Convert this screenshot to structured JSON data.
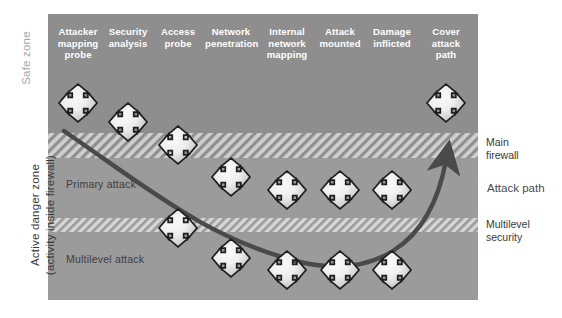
{
  "figure": {
    "type": "diagram"
  },
  "axis_labels": {
    "safe_zone": "Safe zone",
    "danger_zone": "Active danger zone\n(activity inside firewall)"
  },
  "zone_captions": {
    "primary_attack": "Primary attack",
    "multilevel_attack": "Multilevel attack"
  },
  "right_annotations": {
    "main_firewall": "Main\nfirewall",
    "multilevel_security": "Multilevel\nsecurity",
    "attack_path": "Attack path"
  },
  "columns": [
    {
      "label": "Attacker\nmapping\nprobe",
      "x": 78
    },
    {
      "label": "Security\nanalysis",
      "x": 128
    },
    {
      "label": "Access\nprobe",
      "x": 178
    },
    {
      "label": "Network\npenetration",
      "x": 231
    },
    {
      "label": "Internal\nnetwork\nmapping",
      "x": 287
    },
    {
      "label": "Attack\nmounted",
      "x": 340
    },
    {
      "label": "Damage\ninflicted",
      "x": 392
    },
    {
      "label": "Cover\nattack\npath",
      "x": 446
    }
  ],
  "bands": [
    {
      "name": "safe-zone",
      "fill": "#8e8e8e",
      "top": 14,
      "height": 119,
      "pattern": "solid"
    },
    {
      "name": "main-firewall",
      "fill": "#c9c9c9",
      "top": 133,
      "height": 25,
      "pattern": "hatch"
    },
    {
      "name": "primary-attack",
      "fill": "#9b9b9b",
      "top": 158,
      "height": 60,
      "pattern": "solid"
    },
    {
      "name": "multilevel-security",
      "fill": "#cfcfcf",
      "top": 218,
      "height": 14,
      "pattern": "hatch"
    },
    {
      "name": "multilevel-attack",
      "fill": "#9b9b9b",
      "top": 232,
      "height": 68,
      "pattern": "solid"
    }
  ],
  "nodes": [
    {
      "column": 0,
      "cx": 78,
      "cy": 103
    },
    {
      "column": 1,
      "cx": 128,
      "cy": 122
    },
    {
      "column": 2,
      "cx": 178,
      "cy": 145
    },
    {
      "column": 3,
      "cx": 231,
      "cy": 177
    },
    {
      "column": 4,
      "cx": 287,
      "cy": 190
    },
    {
      "column": 5,
      "cx": 340,
      "cy": 190
    },
    {
      "column": 6,
      "cx": 392,
      "cy": 190
    },
    {
      "column": 7,
      "cx": 446,
      "cy": 103
    },
    {
      "column": 2,
      "cx": 178,
      "cy": 228
    },
    {
      "column": 3,
      "cx": 231,
      "cy": 258
    },
    {
      "column": 4,
      "cx": 287,
      "cy": 270
    },
    {
      "column": 5,
      "cx": 340,
      "cy": 270
    },
    {
      "column": 6,
      "cx": 392,
      "cy": 270
    }
  ],
  "plot": {
    "left": 48,
    "top": 14,
    "width": 430,
    "height": 286
  },
  "colors": {
    "safe_zone_fill": "#8e8e8e",
    "danger_zone_fill": "#9b9b9b",
    "firewall_band_fill": "#c9c9c9",
    "security_band_fill": "#cfcfcf",
    "node_stroke": "#1f1f1f",
    "node_fill_light": "#f2f2f2",
    "node_fill_dark": "#bfbfbf",
    "attack_path_stroke": "#4a4a4a",
    "header_text": "#ffffff",
    "body_text": "#3a3a3a",
    "safe_zone_text": "#a8a8a8"
  }
}
